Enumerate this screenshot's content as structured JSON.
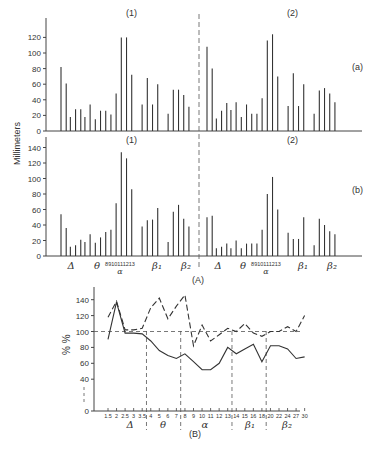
{
  "figure": {
    "panel_A_label": "(A)",
    "panel_B_label": "(B)",
    "ylabel_A": "Millimeters",
    "ylabel_B": "% %"
  },
  "chart_data": [
    {
      "type": "bar",
      "id": "A-a",
      "row_label": "(a)",
      "groups": [
        "(1)",
        "(2)"
      ],
      "ylabel": "Millimeters",
      "ylim": [
        0,
        130
      ],
      "yticks": [
        0,
        20,
        40,
        60,
        80,
        100,
        120
      ],
      "band_labels": [
        "Δ",
        "θ",
        "α",
        "β1",
        "β2"
      ],
      "alpha_tick_labels": [
        "8",
        "9",
        "10",
        "11",
        "12",
        "13"
      ],
      "series": [
        {
          "name": "(1)",
          "values": [
            82,
            61,
            18,
            28,
            28,
            18,
            34,
            15,
            26,
            26,
            21,
            48,
            120,
            120,
            72,
            34,
            68,
            34,
            60,
            22,
            53,
            53,
            46,
            31
          ]
        },
        {
          "name": "(2)",
          "values": [
            108,
            80,
            16,
            26,
            36,
            27,
            37,
            18,
            34,
            22,
            22,
            42,
            116,
            124,
            70,
            32,
            74,
            32,
            60,
            22,
            52,
            55,
            48,
            37
          ]
        }
      ]
    },
    {
      "type": "bar",
      "id": "A-b",
      "row_label": "(b)",
      "groups": [
        "(1)",
        "(2)"
      ],
      "ylabel": "Millimeters",
      "ylim": [
        0,
        150
      ],
      "yticks": [
        0,
        20,
        40,
        60,
        80,
        100,
        120,
        140
      ],
      "band_labels": [
        "Δ",
        "θ",
        "α",
        "β1",
        "β2"
      ],
      "alpha_tick_labels": [
        "8",
        "9",
        "10",
        "11",
        "12",
        "13"
      ],
      "series": [
        {
          "name": "(1)",
          "values": [
            54,
            36,
            12,
            14,
            21,
            18,
            28,
            17,
            24,
            31,
            34,
            68,
            134,
            126,
            86,
            38,
            46,
            47,
            62,
            18,
            57,
            66,
            48,
            38
          ]
        },
        {
          "name": "(2)",
          "values": [
            50,
            52,
            10,
            12,
            16,
            10,
            20,
            10,
            16,
            16,
            16,
            34,
            80,
            102,
            60,
            30,
            22,
            22,
            50,
            14,
            48,
            40,
            32,
            28
          ]
        }
      ]
    },
    {
      "type": "line",
      "id": "B",
      "title": "(B)",
      "ylabel": "% %",
      "ylim": [
        0,
        150
      ],
      "yticks": [
        0,
        40,
        60,
        80,
        100,
        120,
        140
      ],
      "reference_line_y": 100,
      "x_tick_labels": [
        "1.5",
        "2",
        "2.5",
        "3",
        "3.5",
        "4",
        "5",
        "6",
        "7",
        "8",
        "9",
        "10",
        "11",
        "12",
        "13",
        "14",
        "15",
        "16",
        "18",
        "20",
        "22",
        "24",
        "27",
        "30"
      ],
      "band_labels": [
        "Δ",
        "θ",
        "α",
        "β1",
        "β2"
      ],
      "band_boundaries": [
        "3.5|4",
        "7|8",
        "13|14",
        "18|20"
      ],
      "series": [
        {
          "name": "dashed",
          "style": "dashed",
          "values": [
            118,
            138,
            102,
            102,
            104,
            130,
            142,
            116,
            132,
            146,
            82,
            108,
            88,
            96,
            104,
            100,
            110,
            98,
            94,
            100,
            100,
            106,
            100,
            120
          ]
        },
        {
          "name": "solid",
          "style": "solid",
          "values": [
            90,
            137,
            98,
            98,
            97,
            88,
            76,
            70,
            66,
            72,
            62,
            52,
            52,
            60,
            80,
            72,
            78,
            84,
            62,
            82,
            82,
            78,
            66,
            68
          ]
        }
      ]
    }
  ]
}
